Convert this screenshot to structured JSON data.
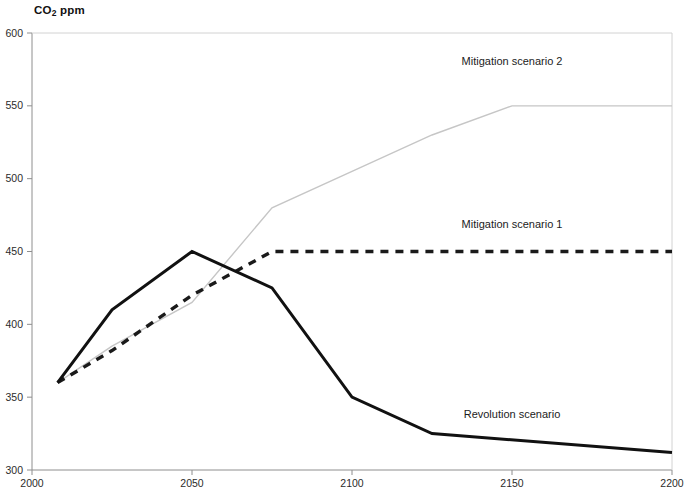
{
  "chart_data": {
    "type": "line",
    "title": "CO2 ppm",
    "title_main": "CO",
    "title_sub": "2",
    "title_tail": " ppm",
    "xlabel": "",
    "ylabel": "CO2 ppm",
    "xlim": [
      2000,
      2200
    ],
    "ylim": [
      300,
      600
    ],
    "grid": false,
    "legend_position": "inline-right",
    "xticks": [
      "2000",
      "2050",
      "2100",
      "2150",
      "2200"
    ],
    "xtick_values": [
      2000,
      2050,
      2100,
      2150,
      2200
    ],
    "yticks": [
      "300",
      "350",
      "400",
      "450",
      "500",
      "550",
      "600"
    ],
    "ytick_values": [
      300,
      350,
      400,
      450,
      500,
      550,
      600
    ],
    "series": [
      {
        "name": "Mitigation scenario 2",
        "style": "solid-thin-gray",
        "color": "#c6c6c6",
        "label_x": 2150,
        "label_y": 578,
        "x": [
          2008,
          2025,
          2050,
          2075,
          2100,
          2125,
          2150,
          2175,
          2200
        ],
        "y": [
          360,
          385,
          415,
          480,
          505,
          530,
          550,
          550,
          550
        ]
      },
      {
        "name": "Mitigation scenario 1",
        "style": "dashed-bold-black",
        "color": "#1a1a1a",
        "label_x": 2150,
        "label_y": 466,
        "x": [
          2008,
          2025,
          2050,
          2075,
          2100,
          2125,
          2150,
          2175,
          2200
        ],
        "y": [
          360,
          382,
          420,
          450,
          450,
          450,
          450,
          450,
          450
        ]
      },
      {
        "name": "Revolution scenario",
        "style": "solid-bold-black",
        "color": "#111111",
        "label_x": 2150,
        "label_y": 336,
        "x": [
          2008,
          2025,
          2050,
          2075,
          2100,
          2125,
          2200
        ],
        "y": [
          360,
          410,
          450,
          425,
          350,
          325,
          312
        ]
      }
    ]
  }
}
